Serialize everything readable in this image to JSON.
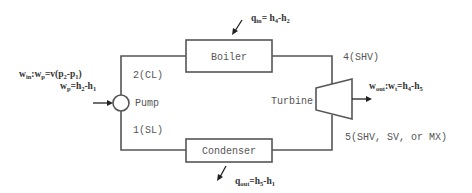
{
  "diagram": {
    "components": {
      "boiler": {
        "label": "Boiler"
      },
      "turbine": {
        "label": "Turbine"
      },
      "condenser": {
        "label": "Condenser"
      },
      "pump": {
        "label": "Pump"
      }
    },
    "states": {
      "s1": "1(SL)",
      "s2": "2(CL)",
      "s4": "4(SHV)",
      "s5": "5(SHV, SV, or MX)"
    },
    "equations": {
      "q_in": {
        "lhs": "q",
        "lhs_sub": "in",
        "rhs": "= h",
        "rhs_sub1": "4",
        "rhs_mid": "-h",
        "rhs_sub2": "2"
      },
      "q_out": {
        "lhs": "q",
        "lhs_sub": "out",
        "rhs": "=h",
        "rhs_sub1": "5",
        "rhs_mid": "-h",
        "rhs_sub2": "1"
      },
      "w_in": {
        "lhs": "w",
        "lhs_sub": "in",
        "mid": ":w",
        "mid_sub": "p",
        "rhs": "=v(p",
        "rhs_sub1": "2",
        "rhs_mid": "-p",
        "rhs_sub2": "1",
        "tail": ")"
      },
      "w_p": {
        "lhs": "w",
        "lhs_sub": "p",
        "rhs": "=h",
        "rhs_sub1": "2",
        "rhs_mid": "-h",
        "rhs_sub2": "1"
      },
      "w_out": {
        "lhs": "w",
        "lhs_sub": "out",
        "mid": ":w",
        "mid_sub": "t",
        "rhs": "=h",
        "rhs_sub1": "4",
        "rhs_mid": "-h",
        "rhs_sub2": "5"
      }
    },
    "colors": {
      "line": "#555555",
      "arrow": "#222222",
      "text": "#555555",
      "background": "#ffffff"
    }
  }
}
